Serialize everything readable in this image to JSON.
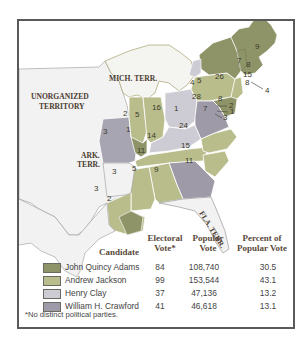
{
  "colors": {
    "adams": "#8e9467",
    "jackson": "#b9bd8c",
    "clay": "#cdcbd3",
    "crawford": "#9e9aa8",
    "territory": "#f1f1f1",
    "frame": "#5a5a5a"
  },
  "map": {
    "territory_labels": {
      "mich": "MICH. TERR.",
      "unorganized_1": "UNORGANIZED",
      "unorganized_2": "TERRITORY",
      "ark_1": "ARK.",
      "ark_2": "TERR.",
      "fla": "FLA. TERR."
    },
    "state_votes": {
      "maine": "9",
      "new_hampshire": "8",
      "vermont": "7",
      "massachusetts": "15",
      "rhode_island": "4",
      "connecticut": "8",
      "new_york_adams": "26",
      "new_york_clay": "4",
      "new_york_jackson": "5",
      "new_jersey": "8",
      "pennsylvania": "28",
      "delaware_adams": "2",
      "delaware_crawford": "1",
      "maryland_adams": "3",
      "maryland_jackson": "7",
      "maryland_crawford": "1",
      "ohio": "16",
      "indiana": "5",
      "illinois_jackson": "2",
      "illinois_adams": "1",
      "missouri": "3",
      "kentucky": "14",
      "virginia": "24",
      "virginia_other": "1",
      "tennessee": "11",
      "north_carolina": "15",
      "south_carolina": "11",
      "georgia": "9",
      "alabama": "5",
      "mississippi": "3",
      "louisiana_west": "3",
      "louisiana": "2"
    }
  },
  "legend": {
    "headers": {
      "candidate": "Candidate",
      "electoral_1": "Electoral",
      "electoral_2": "Vote*",
      "popular_1": "Popular",
      "popular_2": "Vote",
      "percent_1": "Percent of",
      "percent_2": "Popular Vote"
    },
    "rows": [
      {
        "name": "John Quincy Adams",
        "electoral": "84",
        "popular": "108,740",
        "percent": "30.5"
      },
      {
        "name": "Andrew Jackson",
        "electoral": "99",
        "popular": "153,544",
        "percent": "43.1"
      },
      {
        "name": "Henry Clay",
        "electoral": "37",
        "popular": "47,136",
        "percent": "13.2"
      },
      {
        "name": "William H. Crawford",
        "electoral": "41",
        "popular": "46,618",
        "percent": "13.1"
      }
    ],
    "footnote": "*No distinct political parties."
  }
}
